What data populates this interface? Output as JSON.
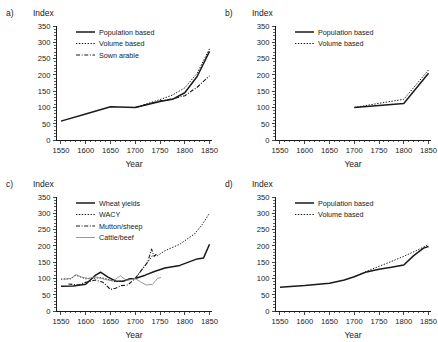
{
  "figure": {
    "width": 438,
    "height": 342,
    "background": "#ffffff",
    "ink": "#1a1a1a",
    "grey": "#808080"
  },
  "common": {
    "ylabel": "Index",
    "xlabel": "Year",
    "xlim": [
      1540,
      1855
    ],
    "ylim": [
      0,
      350
    ],
    "yticks": [
      0,
      50,
      100,
      150,
      200,
      250,
      300,
      350
    ],
    "xticks": [
      1550,
      1600,
      1650,
      1700,
      1750,
      1800,
      1850
    ],
    "xminor_step": 10,
    "grid": false,
    "legend_position": "upper-left-inside"
  },
  "chart_data": [
    {
      "id": "panel-a",
      "panel_label": "a)",
      "type": "line",
      "title": "",
      "ylabel": "Index",
      "xlabel": "Year",
      "xlim": [
        1540,
        1855
      ],
      "ylim": [
        0,
        350
      ],
      "yticks": [
        0,
        50,
        100,
        150,
        200,
        250,
        300,
        350
      ],
      "xticks": [
        1550,
        1600,
        1650,
        1700,
        1750,
        1800,
        1850
      ],
      "grid": false,
      "legend": [
        "Population based",
        "Volume based",
        "Sown arable"
      ],
      "series": [
        {
          "name": "Population based",
          "style": "solid",
          "color": "#1a1a1a",
          "x": [
            1550,
            1600,
            1650,
            1700,
            1750,
            1775,
            1800,
            1825,
            1850
          ],
          "values": [
            58,
            80,
            102,
            100,
            118,
            125,
            145,
            195,
            272
          ]
        },
        {
          "name": "Volume based",
          "style": "dotted",
          "color": "#1a1a1a",
          "x": [
            1700,
            1725,
            1750,
            1775,
            1800,
            1825,
            1850
          ],
          "values": [
            100,
            112,
            124,
            138,
            160,
            205,
            280
          ]
        },
        {
          "name": "Sown arable",
          "style": "dashdot",
          "color": "#1a1a1a",
          "x": [
            1700,
            1725,
            1750,
            1775,
            1800,
            1825,
            1850
          ],
          "values": [
            100,
            110,
            120,
            126,
            136,
            162,
            197
          ]
        }
      ]
    },
    {
      "id": "panel-b",
      "panel_label": "b)",
      "type": "line",
      "title": "",
      "ylabel": "Index",
      "xlabel": "Year",
      "xlim": [
        1540,
        1855
      ],
      "ylim": [
        0,
        350
      ],
      "yticks": [
        0,
        50,
        100,
        150,
        200,
        250,
        300,
        350
      ],
      "xticks": [
        1550,
        1600,
        1650,
        1700,
        1750,
        1800,
        1850
      ],
      "grid": false,
      "legend": [
        "Population based",
        "Volume based"
      ],
      "series": [
        {
          "name": "Population based",
          "style": "solid",
          "color": "#1a1a1a",
          "x": [
            1700,
            1800,
            1850
          ],
          "values": [
            100,
            112,
            205
          ]
        },
        {
          "name": "Volume based",
          "style": "dotted",
          "color": "#1a1a1a",
          "x": [
            1700,
            1800,
            1850
          ],
          "values": [
            100,
            125,
            215
          ]
        }
      ]
    },
    {
      "id": "panel-c",
      "panel_label": "c)",
      "type": "line",
      "title": "",
      "ylabel": "Index",
      "xlabel": "Year",
      "xlim": [
        1540,
        1855
      ],
      "ylim": [
        0,
        350
      ],
      "yticks": [
        0,
        50,
        100,
        150,
        200,
        250,
        300,
        350
      ],
      "xticks": [
        1550,
        1600,
        1650,
        1700,
        1750,
        1800,
        1850
      ],
      "grid": false,
      "legend": [
        "Wheat yields",
        "WACY",
        "Mutton/sheep",
        "Cattle/beef"
      ],
      "series": [
        {
          "name": "Wheat yields",
          "style": "solid",
          "color": "#1a1a1a",
          "x": [
            1550,
            1575,
            1600,
            1620,
            1630,
            1645,
            1660,
            1675,
            1690,
            1700,
            1720,
            1740,
            1760,
            1790,
            1825,
            1838,
            1850
          ],
          "values": [
            76,
            77,
            82,
            110,
            119,
            104,
            92,
            91,
            99,
            100,
            110,
            122,
            132,
            140,
            160,
            163,
            205
          ]
        },
        {
          "name": "WACY",
          "style": "dotted",
          "color": "#1a1a1a",
          "x": [
            1550,
            1570,
            1580,
            1590,
            1600,
            1620,
            1630,
            1645,
            1660,
            1675,
            1690,
            1700,
            1720,
            1735,
            1745,
            1760,
            1790,
            1820,
            1835,
            1850
          ],
          "values": [
            98,
            99,
            110,
            104,
            99,
            101,
            103,
            97,
            90,
            92,
            100,
            100,
            140,
            170,
            170,
            185,
            205,
            237,
            265,
            300
          ]
        },
        {
          "name": "Mutton/sheep",
          "style": "dashdot",
          "color": "#1a1a1a",
          "x": [
            1565,
            1585,
            1600,
            1620,
            1635,
            1650,
            1660,
            1672,
            1685,
            1700,
            1715,
            1725,
            1733,
            1738,
            1745
          ],
          "values": [
            83,
            80,
            88,
            95,
            88,
            66,
            70,
            78,
            80,
            100,
            130,
            150,
            190,
            168,
            177
          ]
        },
        {
          "name": "Cattle/beef",
          "style": "solid-thin",
          "color": "#8c8c8c",
          "x": [
            1555,
            1570,
            1580,
            1592,
            1605,
            1620,
            1630,
            1645,
            1655,
            1670,
            1682,
            1690,
            1700,
            1712,
            1722,
            1735,
            1745,
            1752
          ],
          "values": [
            97,
            100,
            112,
            104,
            100,
            105,
            100,
            95,
            92,
            108,
            94,
            96,
            100,
            88,
            80,
            82,
            100,
            103
          ]
        }
      ]
    },
    {
      "id": "panel-d",
      "panel_label": "d)",
      "type": "line",
      "title": "",
      "ylabel": "Index",
      "xlabel": "Year",
      "xlim": [
        1540,
        1855
      ],
      "ylim": [
        0,
        350
      ],
      "yticks": [
        0,
        50,
        100,
        150,
        200,
        250,
        300,
        350
      ],
      "xticks": [
        1550,
        1600,
        1650,
        1700,
        1750,
        1800,
        1850
      ],
      "grid": false,
      "legend": [
        "Population based",
        "Volume based"
      ],
      "series": [
        {
          "name": "Population based",
          "style": "solid",
          "color": "#1a1a1a",
          "x": [
            1550,
            1600,
            1650,
            1680,
            1700,
            1725,
            1750,
            1775,
            1800,
            1820,
            1840,
            1850
          ],
          "values": [
            73,
            78,
            85,
            95,
            105,
            120,
            128,
            134,
            141,
            170,
            193,
            198
          ]
        },
        {
          "name": "Volume based",
          "style": "dotted",
          "color": "#1a1a1a",
          "x": [
            1700,
            1725,
            1750,
            1775,
            1800,
            1825,
            1845,
            1850
          ],
          "values": [
            105,
            122,
            137,
            152,
            168,
            185,
            200,
            205
          ]
        }
      ]
    }
  ]
}
